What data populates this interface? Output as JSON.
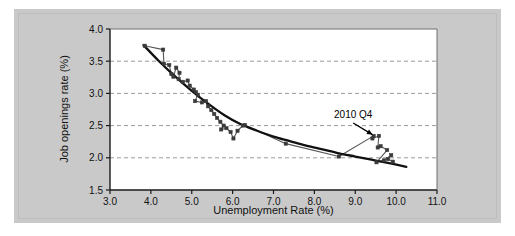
{
  "figure": {
    "background_color": "#c9c9c9",
    "plot_background_color": "#ffffff",
    "axis_color": "#1a1a1a",
    "grid_color": "#9a9a9a",
    "marker_color": "#3a3a3a",
    "series_line_color": "#555555",
    "fit_line_color": "#111111",
    "annotation_color": "#000000"
  },
  "chart_data": {
    "type": "scatter",
    "title": "",
    "subtitle": "",
    "xlabel": "Unemployment Rate (%)",
    "ylabel": "Job openings rate (%)",
    "xlim": [
      3.0,
      11.0
    ],
    "ylim": [
      1.5,
      4.0
    ],
    "xticks": [
      "3.0",
      "4.0",
      "5.0",
      "6.0",
      "7.0",
      "8.0",
      "9.0",
      "10.0",
      "11.0"
    ],
    "xtick_values": [
      3.0,
      4.0,
      5.0,
      6.0,
      7.0,
      8.0,
      9.0,
      10.0,
      11.0
    ],
    "yticks": [
      "1.5",
      "2.0",
      "2.5",
      "3.0",
      "3.5",
      "4.0"
    ],
    "ytick_values": [
      1.5,
      2.0,
      2.5,
      3.0,
      3.5,
      4.0
    ],
    "grid": "horizontal-dashed",
    "grid_values": [
      2.0,
      2.5,
      3.0,
      3.5
    ],
    "legend": "none",
    "legend_position": "none",
    "series": [
      {
        "name": "Beveridge curve observations",
        "marker": "square",
        "connected": true,
        "x": [
          3.85,
          4.3,
          4.32,
          4.45,
          4.5,
          4.55,
          4.62,
          4.7,
          4.68,
          4.78,
          4.9,
          4.95,
          5.05,
          5.1,
          5.15,
          5.08,
          5.25,
          5.35,
          5.4,
          5.48,
          5.55,
          5.62,
          5.7,
          5.78,
          5.72,
          5.85,
          5.95,
          6.02,
          6.12,
          6.25,
          6.3,
          7.3,
          8.6,
          9.45,
          9.42,
          9.58,
          9.55,
          9.62,
          9.78,
          9.52,
          9.7,
          9.88,
          9.8,
          9.92
        ],
        "y": [
          3.74,
          3.68,
          3.46,
          3.44,
          3.3,
          3.26,
          3.4,
          3.32,
          3.22,
          3.18,
          3.2,
          3.12,
          3.06,
          3.02,
          2.98,
          2.88,
          2.86,
          2.88,
          2.8,
          2.74,
          2.68,
          2.62,
          2.56,
          2.5,
          2.44,
          2.46,
          2.4,
          2.3,
          2.42,
          2.5,
          2.51,
          2.22,
          2.02,
          2.34,
          2.3,
          2.34,
          2.16,
          2.18,
          2.12,
          1.93,
          1.96,
          2.04,
          1.98,
          1.94
        ]
      },
      {
        "name": "Fitted curve",
        "marker": "none",
        "connected": true,
        "x": [
          3.82,
          4.2,
          4.6,
          5.0,
          5.4,
          5.8,
          6.2,
          6.6,
          7.0,
          7.4,
          7.8,
          8.2,
          8.6,
          9.0,
          9.4,
          9.8,
          10.25
        ],
        "y": [
          3.75,
          3.5,
          3.26,
          3.04,
          2.84,
          2.66,
          2.52,
          2.42,
          2.33,
          2.26,
          2.19,
          2.13,
          2.07,
          2.02,
          1.97,
          1.92,
          1.86
        ]
      }
    ],
    "annotations": [
      {
        "text": "2010 Q4",
        "label_x": 8.95,
        "label_y": 2.62,
        "arrow_from_x": 8.95,
        "arrow_from_y": 2.54,
        "arrow_to_x": 9.42,
        "arrow_to_y": 2.36
      }
    ]
  }
}
